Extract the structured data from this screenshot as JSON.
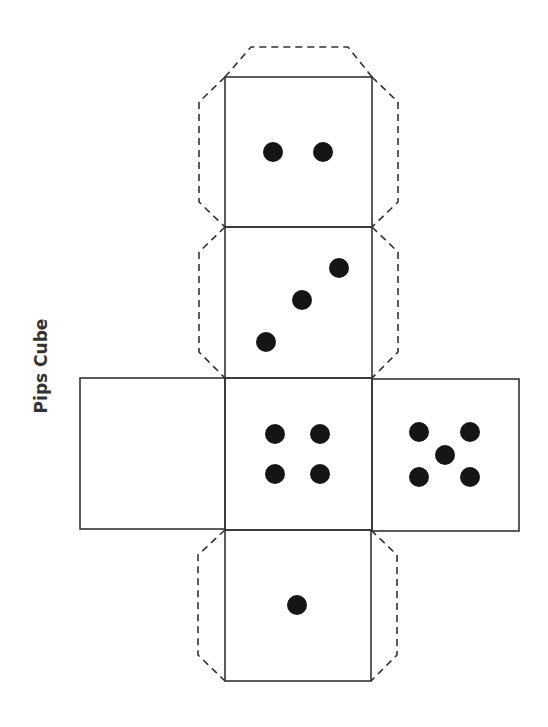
{
  "title": "Pips Cube",
  "colors": {
    "line": "#333333",
    "pip": "#151515",
    "background": "#ffffff"
  },
  "faces": [
    {
      "id": "top",
      "pips": 2,
      "x": 225,
      "y": 77,
      "w": 147,
      "h": 150,
      "pip_positions": [
        [
          273,
          152
        ],
        [
          323,
          152
        ]
      ]
    },
    {
      "id": "upper-middle",
      "pips": 3,
      "x": 225,
      "y": 227,
      "w": 147,
      "h": 151,
      "pip_positions": [
        [
          266,
          342
        ],
        [
          302,
          300
        ],
        [
          339,
          268
        ]
      ]
    },
    {
      "id": "left",
      "pips": 0,
      "x": 80,
      "y": 378,
      "w": 145,
      "h": 151,
      "pip_positions": []
    },
    {
      "id": "center",
      "pips": 4,
      "x": 225,
      "y": 378,
      "w": 147,
      "h": 152,
      "pip_positions": [
        [
          275,
          434
        ],
        [
          320,
          434
        ],
        [
          275,
          474
        ],
        [
          320,
          474
        ]
      ]
    },
    {
      "id": "right",
      "pips": 5,
      "x": 372,
      "y": 379,
      "w": 147,
      "h": 152,
      "pip_positions": [
        [
          419,
          432
        ],
        [
          470,
          432
        ],
        [
          445,
          455
        ],
        [
          419,
          477
        ],
        [
          470,
          477
        ]
      ]
    },
    {
      "id": "bottom",
      "pips": 1,
      "x": 225,
      "y": 530,
      "w": 146,
      "h": 151,
      "pip_positions": [
        [
          297,
          605
        ]
      ]
    }
  ],
  "glue_tabs": [
    {
      "id": "top-cap",
      "points": "225,77 251,47 348,47 372,77"
    },
    {
      "id": "top-left",
      "points": "225,77 199,102 199,202 225,227"
    },
    {
      "id": "top-right",
      "points": "372,77 398,102 398,202 372,227"
    },
    {
      "id": "mid-left",
      "points": "225,227 199,252 199,352 225,378"
    },
    {
      "id": "mid-right",
      "points": "372,227 398,252 398,352 372,378"
    },
    {
      "id": "bottom-left",
      "points": "225,530 198,555 198,655 225,681"
    },
    {
      "id": "bottom-right",
      "points": "371,530 397,555 397,655 371,681"
    }
  ]
}
